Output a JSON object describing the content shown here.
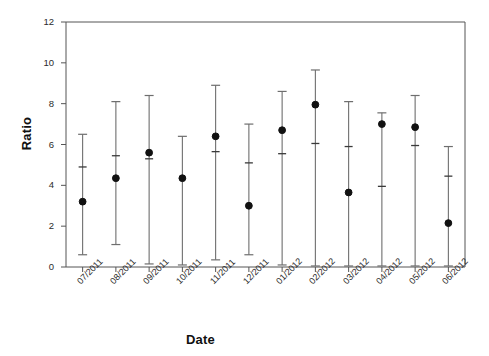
{
  "chart_data": {
    "type": "scatter",
    "title": "",
    "xlabel": "Date",
    "ylabel": "Ratio",
    "ylim": [
      0,
      12
    ],
    "yticks": [
      0,
      2,
      4,
      6,
      8,
      10,
      12
    ],
    "grid": false,
    "legend": null,
    "categories": [
      "07/2011",
      "08/2011",
      "09/2011",
      "10/2011",
      "11/2011",
      "12/2011",
      "01/2012",
      "02/2012",
      "03/2012",
      "04/2012",
      "05/2012",
      "06/2012"
    ],
    "series": [
      {
        "name": "Ratio",
        "marker": "filled-circle",
        "values": [
          3.2,
          4.35,
          5.6,
          4.35,
          6.4,
          3.0,
          6.7,
          7.95,
          3.65,
          7.0,
          6.85,
          2.15
        ],
        "error_upper": [
          6.5,
          8.1,
          8.4,
          6.4,
          8.9,
          7.0,
          8.6,
          9.65,
          8.1,
          7.55,
          8.4,
          5.9
        ],
        "error_lower": [
          0.6,
          1.1,
          0.15,
          0.1,
          0.35,
          0.6,
          0.1,
          0.05,
          0.05,
          0.05,
          0.05,
          0.05
        ],
        "inner_tick": [
          4.9,
          5.45,
          5.3,
          null,
          5.65,
          5.1,
          5.55,
          6.05,
          5.9,
          3.95,
          5.95,
          4.45
        ]
      }
    ],
    "colors": {
      "marker": "#111111",
      "whisker": "#6e6e6e",
      "axis": "#555555",
      "text": "#2b2b2b",
      "background": "#ffffff"
    }
  }
}
